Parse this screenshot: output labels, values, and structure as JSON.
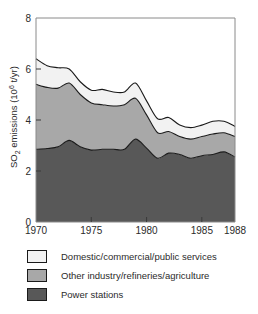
{
  "chart_data": {
    "type": "area",
    "stacked": true,
    "title": "",
    "xlabel": "",
    "ylabel": "SO2 emissions (10^6 t/yr)",
    "ylabel_parts": {
      "prefix": "SO",
      "subscript": "2",
      "middle": " emissions (10",
      "superscript": "6",
      "suffix": " t/yr)"
    },
    "xlim": [
      1970,
      1988
    ],
    "ylim": [
      0,
      8
    ],
    "xticks": [
      1970,
      1975,
      1980,
      1985,
      1988
    ],
    "yticks": [
      0,
      2,
      4,
      6,
      8
    ],
    "grid": false,
    "legend_position": "below-plot",
    "x": [
      1970,
      1971,
      1972,
      1973,
      1974,
      1975,
      1976,
      1977,
      1978,
      1979,
      1980,
      1981,
      1982,
      1983,
      1984,
      1985,
      1986,
      1987,
      1988
    ],
    "series": [
      {
        "name": "Power stations",
        "color": "#585858",
        "values": [
          2.85,
          2.88,
          2.95,
          3.2,
          2.95,
          2.82,
          2.85,
          2.85,
          2.85,
          3.25,
          2.9,
          2.5,
          2.7,
          2.65,
          2.5,
          2.6,
          2.65,
          2.75,
          2.55
        ]
      },
      {
        "name": "Other industry/refineries/agriculture",
        "color": "#a8a8a8",
        "values": [
          2.55,
          2.4,
          2.3,
          2.25,
          2.05,
          1.85,
          1.75,
          1.7,
          1.75,
          1.6,
          1.3,
          1.0,
          0.85,
          0.7,
          0.75,
          0.75,
          0.8,
          0.75,
          0.8
        ]
      },
      {
        "name": "Domestic/commercial/public services",
        "color": "#f2f2f2",
        "values": [
          1.0,
          0.85,
          0.8,
          0.55,
          0.5,
          0.5,
          0.6,
          0.55,
          0.5,
          0.6,
          0.55,
          0.55,
          0.55,
          0.45,
          0.45,
          0.45,
          0.5,
          0.45,
          0.4
        ]
      }
    ],
    "cumulative_tops": {
      "power_stations": [
        2.85,
        2.88,
        2.95,
        3.2,
        2.95,
        2.82,
        2.85,
        2.85,
        2.85,
        3.25,
        2.9,
        2.5,
        2.7,
        2.65,
        2.5,
        2.6,
        2.65,
        2.75,
        2.55
      ],
      "plus_other_industry": [
        5.4,
        5.28,
        5.25,
        5.45,
        5.0,
        4.67,
        4.6,
        4.55,
        4.6,
        4.85,
        4.2,
        3.5,
        3.55,
        3.35,
        3.25,
        3.35,
        3.45,
        3.5,
        3.35
      ],
      "plus_domestic": [
        6.4,
        6.13,
        6.05,
        6.0,
        5.5,
        5.17,
        5.2,
        5.1,
        5.1,
        5.45,
        4.75,
        4.05,
        4.1,
        3.8,
        3.7,
        3.8,
        3.95,
        3.95,
        3.75
      ]
    }
  },
  "axis": {
    "ytick_labels": [
      "0",
      "2",
      "4",
      "6",
      "8"
    ],
    "xtick_labels": [
      "1970",
      "1975",
      "1980",
      "1985",
      "1988"
    ]
  },
  "legend": {
    "items": [
      {
        "label": "Domestic/commercial/public services",
        "color": "#f2f2f2"
      },
      {
        "label": "Other industry/refineries/agriculture",
        "color": "#a8a8a8"
      },
      {
        "label": "Power stations",
        "color": "#585858"
      }
    ]
  }
}
